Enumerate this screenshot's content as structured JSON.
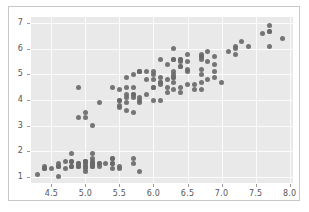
{
  "figure": {
    "background_color": "#ffffff",
    "border_color": "#c8c8c8",
    "panel_color": "#e9e9e9",
    "grid_color": "#fbfbfb",
    "point_color": "#6a6a6a",
    "tick_label_color": "#55565a"
  },
  "chart_data": {
    "type": "scatter",
    "title": "",
    "xlabel": "",
    "ylabel": "",
    "xlim": [
      4.2,
      8.05
    ],
    "ylim": [
      0.75,
      7.25
    ],
    "xticks": [
      4.5,
      5.0,
      5.5,
      6.0,
      6.5,
      7.0,
      7.5,
      8.0
    ],
    "xtick_labels": [
      "4.5",
      "5.0",
      "5.5",
      "6.0",
      "6.5",
      "7.0",
      "7.5",
      "8.0"
    ],
    "yticks": [
      1,
      2,
      3,
      4,
      5,
      6,
      7
    ],
    "ytick_labels": [
      "1",
      "2",
      "3",
      "4",
      "5",
      "6",
      "7"
    ],
    "grid": true,
    "legend": "none",
    "marker": "circle",
    "marker_size": 5,
    "series": [
      {
        "name": "points",
        "x": [
          5.1,
          4.9,
          4.7,
          4.6,
          5.0,
          5.4,
          4.6,
          5.0,
          4.4,
          4.9,
          5.4,
          4.8,
          4.8,
          4.3,
          5.8,
          5.7,
          5.4,
          5.1,
          5.7,
          5.1,
          5.4,
          5.1,
          4.6,
          5.1,
          4.8,
          5.0,
          5.0,
          5.2,
          5.2,
          4.7,
          4.8,
          5.4,
          5.2,
          5.5,
          4.9,
          5.0,
          5.5,
          4.9,
          4.4,
          5.1,
          5.0,
          4.5,
          4.4,
          5.0,
          5.1,
          4.8,
          5.1,
          4.6,
          5.3,
          5.0,
          7.0,
          6.4,
          6.9,
          5.5,
          6.5,
          5.7,
          6.3,
          4.9,
          6.6,
          5.2,
          5.0,
          5.9,
          6.0,
          6.1,
          5.6,
          6.7,
          5.6,
          5.8,
          6.2,
          5.6,
          5.9,
          6.1,
          6.3,
          6.1,
          6.4,
          6.6,
          6.8,
          6.7,
          6.0,
          5.7,
          5.5,
          5.5,
          5.8,
          6.0,
          5.4,
          6.0,
          6.7,
          6.3,
          5.6,
          5.5,
          5.5,
          6.1,
          5.8,
          5.0,
          5.6,
          5.7,
          5.7,
          6.2,
          5.1,
          5.7,
          6.3,
          5.8,
          7.1,
          6.3,
          6.5,
          7.6,
          4.9,
          7.3,
          6.7,
          7.2,
          6.5,
          6.4,
          6.8,
          5.7,
          5.8,
          6.4,
          6.5,
          7.7,
          7.7,
          6.0,
          6.9,
          5.6,
          7.7,
          6.3,
          6.7,
          7.2,
          6.2,
          6.1,
          6.4,
          7.2,
          7.4,
          7.9,
          6.4,
          6.3,
          6.1,
          7.7,
          6.3,
          6.4,
          6.0,
          6.9,
          6.7,
          6.9,
          5.8,
          6.8,
          6.7,
          6.7,
          6.3,
          6.5,
          6.2,
          5.9
        ],
        "y": [
          1.4,
          1.4,
          1.3,
          1.5,
          1.4,
          1.7,
          1.4,
          1.5,
          1.4,
          1.5,
          1.5,
          1.6,
          1.4,
          1.1,
          1.2,
          1.5,
          1.3,
          1.4,
          1.7,
          1.5,
          1.7,
          1.5,
          1.0,
          1.7,
          1.9,
          1.6,
          1.6,
          1.5,
          1.4,
          1.6,
          1.6,
          1.5,
          1.5,
          1.4,
          1.5,
          1.2,
          1.3,
          1.4,
          1.3,
          1.5,
          1.3,
          1.3,
          1.3,
          1.6,
          1.9,
          1.4,
          1.6,
          1.4,
          1.5,
          1.4,
          4.7,
          4.5,
          4.9,
          4.0,
          4.6,
          4.5,
          4.7,
          3.3,
          4.6,
          3.9,
          3.5,
          4.2,
          4.0,
          4.7,
          3.6,
          4.4,
          4.5,
          4.1,
          4.5,
          3.9,
          4.8,
          4.0,
          4.9,
          4.7,
          4.3,
          4.4,
          4.8,
          5.0,
          4.5,
          3.5,
          3.8,
          3.7,
          3.9,
          5.1,
          4.5,
          4.5,
          4.7,
          4.4,
          4.1,
          4.0,
          4.4,
          4.6,
          4.0,
          3.3,
          4.2,
          4.2,
          4.2,
          4.3,
          3.0,
          4.1,
          6.0,
          5.1,
          5.9,
          5.6,
          5.8,
          6.6,
          4.5,
          6.3,
          5.8,
          6.1,
          5.1,
          5.3,
          5.5,
          5.0,
          5.1,
          5.3,
          5.5,
          6.7,
          6.9,
          5.0,
          5.7,
          4.9,
          6.7,
          4.9,
          5.7,
          6.0,
          4.8,
          4.9,
          5.6,
          5.8,
          6.1,
          6.4,
          5.6,
          5.1,
          5.6,
          6.1,
          5.6,
          5.5,
          4.8,
          5.4,
          5.6,
          5.1,
          5.1,
          5.9,
          5.7,
          5.2,
          5.0,
          5.2,
          5.4,
          5.1
        ]
      }
    ]
  }
}
